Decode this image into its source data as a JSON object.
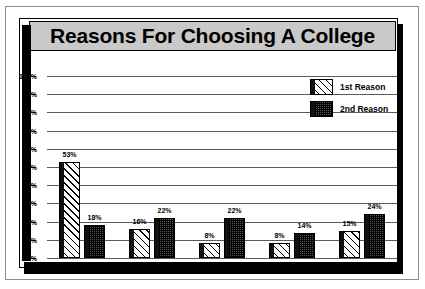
{
  "chart_data": {
    "type": "bar",
    "title": "Reasons For Choosing A College",
    "xlabel": "",
    "ylabel": "",
    "ylim": [
      0,
      100
    ],
    "grid": true,
    "legend_position": "top-right",
    "categories": [
      "Nearby Location",
      "Type of Program",
      "Low Cost",
      "Academic Quality",
      "Others"
    ],
    "ytick_labels": [
      "0%",
      "10%",
      "20%",
      "30%",
      "40%",
      "50%",
      "60%",
      "70%",
      "80%",
      "90%",
      "100%"
    ],
    "ytick_values": [
      0,
      10,
      20,
      30,
      40,
      50,
      60,
      70,
      80,
      90,
      100
    ],
    "series": [
      {
        "name": "1st Reason",
        "pattern": "diagonal-hatch",
        "values": [
          53,
          16,
          8,
          8,
          15
        ],
        "labels": [
          "53%",
          "16%",
          "8%",
          "8%",
          "15%"
        ]
      },
      {
        "name": "2nd Reason",
        "pattern": "checkered-dark",
        "values": [
          18,
          22,
          22,
          14,
          24
        ],
        "labels": [
          "18%",
          "22%",
          "22%",
          "14%",
          "24%"
        ]
      }
    ]
  },
  "colors": {
    "title_banner_bg": "#c9c9c9",
    "gridline": "#5a5a5a",
    "axis_spine": "#000000",
    "card_bg": "#ffffff",
    "frame": "#8d8d8d",
    "shadow": "#000000",
    "second_series_fill": "#5b5b5b"
  }
}
